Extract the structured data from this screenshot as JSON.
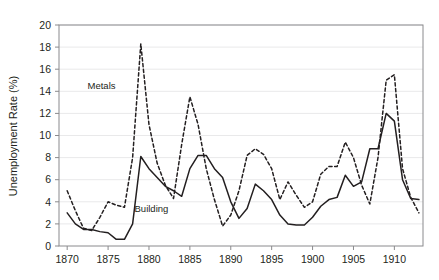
{
  "chart_data": {
    "type": "line",
    "title": "",
    "subtitle": "",
    "xlabel": "",
    "ylabel": "Unemployment Rate (%)",
    "xlim": [
      1869,
      1913.5
    ],
    "ylim": [
      0,
      20
    ],
    "grid": true,
    "grid_axis": "y",
    "legend": "inline-annotations",
    "x_ticks": [
      1870,
      1875,
      1880,
      1885,
      1890,
      1895,
      1900,
      1905,
      1910
    ],
    "x_tick_labels": [
      "1870",
      "1875",
      "1880",
      "1885",
      "1890",
      "1895",
      "1900",
      "1905",
      "1910"
    ],
    "y_ticks": [
      0,
      2,
      4,
      6,
      8,
      10,
      12,
      14,
      16,
      18,
      20
    ],
    "y_tick_labels": [
      "0",
      "2",
      "4",
      "6",
      "8",
      "10",
      "12",
      "14",
      "16",
      "18",
      "20"
    ],
    "x": [
      1870,
      1871,
      1872,
      1873,
      1874,
      1875,
      1876,
      1877,
      1878,
      1879,
      1880,
      1881,
      1882,
      1883,
      1884,
      1885,
      1886,
      1887,
      1888,
      1889,
      1890,
      1891,
      1892,
      1893,
      1894,
      1895,
      1896,
      1897,
      1898,
      1899,
      1900,
      1901,
      1902,
      1903,
      1904,
      1905,
      1906,
      1907,
      1908,
      1909,
      1910,
      1911,
      1912,
      1913
    ],
    "series": [
      {
        "name": "Metals",
        "style": "dashed",
        "color": "#231f20",
        "label_position": {
          "x": 1874.2,
          "y": 14.2
        },
        "values": [
          5.0,
          3.2,
          1.6,
          1.4,
          2.6,
          4.0,
          3.7,
          3.5,
          8.0,
          18.3,
          11.0,
          7.5,
          5.5,
          4.3,
          9.2,
          13.5,
          11.0,
          7.0,
          4.2,
          1.8,
          2.8,
          5.0,
          8.2,
          8.8,
          8.3,
          7.0,
          4.2,
          5.8,
          4.6,
          3.5,
          4.0,
          6.5,
          7.2,
          7.2,
          9.4,
          8.0,
          5.5,
          3.8,
          8.0,
          15.0,
          15.5,
          7.0,
          4.4,
          3.0
        ]
      },
      {
        "name": "Building",
        "style": "solid",
        "color": "#231f20",
        "label_position": {
          "x": 1880.3,
          "y": 3.1
        },
        "values": [
          3.0,
          2.0,
          1.5,
          1.5,
          1.3,
          1.2,
          0.6,
          0.6,
          2.0,
          8.1,
          7.0,
          6.2,
          5.4,
          5.0,
          4.5,
          7.0,
          8.2,
          8.2,
          7.0,
          6.2,
          4.0,
          2.5,
          3.4,
          5.6,
          5.0,
          4.2,
          2.8,
          2.0,
          1.9,
          1.9,
          2.6,
          3.6,
          4.2,
          4.4,
          6.4,
          5.4,
          5.8,
          8.8,
          8.8,
          12.0,
          11.3,
          6.0,
          4.3,
          4.2
        ]
      }
    ]
  }
}
